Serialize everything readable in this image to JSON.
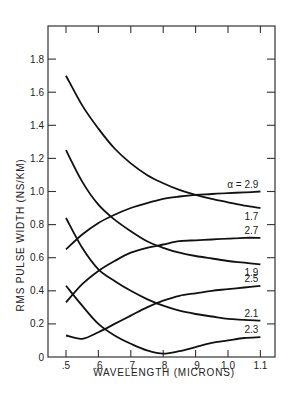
{
  "chart_data": {
    "type": "line",
    "title": "",
    "xlabel": "WAVELENGTH (MICRONS)",
    "ylabel": "RMS PULSE WIDTH (NS/KM)",
    "xlim": [
      0.45,
      1.15
    ],
    "ylim": [
      0,
      2.0
    ],
    "x_ticks": [
      0.5,
      0.6,
      0.7,
      0.8,
      0.9,
      1.0,
      1.1
    ],
    "x_tick_labels": [
      ".5",
      ".6",
      ".7",
      ".8",
      ".9",
      "1.0",
      "1.1"
    ],
    "y_ticks": [
      0,
      0.2,
      0.4,
      0.6,
      0.8,
      1.0,
      1.2,
      1.4,
      1.6,
      1.8
    ],
    "y_tick_labels": [
      "0",
      "0.2",
      "0.4",
      "0.6",
      "0.8",
      "1.0",
      "1.2",
      "1.4",
      "1.6",
      "1.8"
    ],
    "grid": false,
    "legend": "inline labels at right end of curves",
    "annotation": "α = 2.9",
    "x": [
      0.5,
      0.55,
      0.6,
      0.65,
      0.7,
      0.75,
      0.8,
      0.85,
      0.9,
      0.95,
      1.0,
      1.05,
      1.1
    ],
    "series": [
      {
        "name": "1.7",
        "label": "1.7",
        "values": [
          1.7,
          1.52,
          1.38,
          1.26,
          1.17,
          1.1,
          1.05,
          1.01,
          0.98,
          0.955,
          0.935,
          0.915,
          0.9
        ]
      },
      {
        "name": "1.9",
        "label": "1.9",
        "values": [
          1.25,
          1.06,
          0.92,
          0.83,
          0.76,
          0.7,
          0.66,
          0.63,
          0.61,
          0.595,
          0.58,
          0.57,
          0.56
        ]
      },
      {
        "name": "2.1",
        "label": "2.1",
        "values": [
          0.84,
          0.66,
          0.53,
          0.46,
          0.4,
          0.35,
          0.31,
          0.28,
          0.26,
          0.245,
          0.23,
          0.225,
          0.22
        ]
      },
      {
        "name": "2.3",
        "label": "2.3",
        "values": [
          0.43,
          0.31,
          0.2,
          0.13,
          0.08,
          0.04,
          0.02,
          0.035,
          0.06,
          0.085,
          0.1,
          0.115,
          0.12
        ]
      },
      {
        "name": "2.5",
        "label": "2.5",
        "values": [
          0.13,
          0.11,
          0.15,
          0.2,
          0.25,
          0.3,
          0.34,
          0.37,
          0.385,
          0.4,
          0.41,
          0.42,
          0.43
        ]
      },
      {
        "name": "2.7",
        "label": "2.7",
        "values": [
          0.33,
          0.44,
          0.52,
          0.58,
          0.63,
          0.66,
          0.68,
          0.7,
          0.705,
          0.71,
          0.715,
          0.72,
          0.72
        ]
      },
      {
        "name": "2.9",
        "label": "α = 2.9",
        "values": [
          0.65,
          0.74,
          0.81,
          0.86,
          0.9,
          0.93,
          0.955,
          0.97,
          0.98,
          0.985,
          0.99,
          0.995,
          1.0
        ]
      }
    ]
  }
}
